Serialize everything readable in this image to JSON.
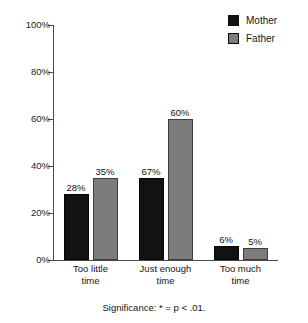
{
  "chart_data": {
    "type": "bar",
    "title": "",
    "subtitle": "",
    "xlabel": "",
    "ylabel": "",
    "ylim": [
      0,
      100
    ],
    "grid": false,
    "legend_position": "top-right",
    "categories": [
      "Too little time",
      "Just enough time",
      "Too much time"
    ],
    "category_lines": [
      [
        "Too little",
        "time"
      ],
      [
        "Just enough",
        "time"
      ],
      [
        "Too much",
        "time"
      ]
    ],
    "series": [
      {
        "name": "Mother",
        "color": "#121212",
        "values": [
          28,
          35,
          6
        ],
        "labels": [
          "28%",
          "67%",
          "6%"
        ]
      },
      {
        "name": "Father",
        "color": "#7c7c7c",
        "values": [
          35,
          60,
          5
        ],
        "labels": [
          "35%",
          "60%",
          "5%"
        ]
      }
    ],
    "yticks": [
      0,
      20,
      40,
      60,
      80,
      100
    ],
    "ytick_labels": [
      "0%",
      "20%",
      "40%",
      "60%",
      "80%",
      "100%"
    ],
    "annotations": [
      "Significance: * = p < .01."
    ]
  },
  "legend": {
    "items": [
      {
        "label": "Mother",
        "swatch": "legend-swatch-mother"
      },
      {
        "label": "Father",
        "swatch": "legend-swatch-father"
      }
    ]
  },
  "caption": {
    "text": "Significance: * = p < .01."
  },
  "colors": {
    "mother": "#121212",
    "father": "#7c7c7c",
    "axis": "#4a4a4a",
    "text": "#141414",
    "background": "#ffffff"
  }
}
